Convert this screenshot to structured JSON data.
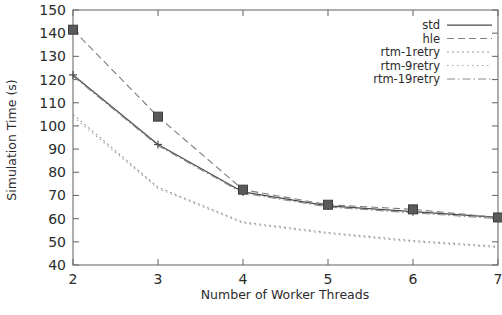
{
  "chart_data": {
    "type": "line",
    "title": "",
    "xlabel": "Number of Worker Threads",
    "ylabel": "Simulation Time (s)",
    "xlim": [
      2,
      7
    ],
    "ylim": [
      40,
      150
    ],
    "xticks": [
      2,
      3,
      4,
      5,
      6,
      7
    ],
    "yticks": [
      40,
      50,
      60,
      70,
      80,
      90,
      100,
      110,
      120,
      130,
      140,
      150
    ],
    "grid": false,
    "legend_position": "top-right",
    "x": [
      2,
      3,
      4,
      5,
      6,
      7
    ],
    "series": [
      {
        "name": "std",
        "style": "solid",
        "color": "#4a4a4a",
        "marker": "plus",
        "values": [
          122,
          92,
          71.5,
          65.5,
          63,
          60.5
        ]
      },
      {
        "name": "hle",
        "style": "dashed",
        "color": "#7d7d7d",
        "marker": "square",
        "values": [
          141.5,
          104,
          72.5,
          66,
          64,
          60.5
        ]
      },
      {
        "name": "rtm-1retry",
        "style": "dotted",
        "color": "#9a9a9a",
        "marker": "none",
        "values": [
          105,
          73.5,
          58.5,
          54,
          50.5,
          48
        ]
      },
      {
        "name": "rtm-9retry",
        "style": "fine-dotted",
        "color": "#a8a8a8",
        "marker": "none",
        "values": [
          104,
          73,
          58,
          53.5,
          50,
          47.5
        ]
      },
      {
        "name": "rtm-19retry",
        "style": "dash-dot",
        "color": "#8a8a8a",
        "marker": "none",
        "values": [
          121.5,
          91.5,
          71,
          65,
          62.5,
          60
        ]
      }
    ]
  },
  "axes": {
    "x_tick_labels": [
      "2",
      "3",
      "4",
      "5",
      "6",
      "7"
    ],
    "y_tick_labels": [
      "40",
      "50",
      "60",
      "70",
      "80",
      "90",
      "100",
      "110",
      "120",
      "130",
      "140",
      "150"
    ],
    "x_axis_title": "Number of Worker Threads",
    "y_axis_title": "Simulation Time (s)"
  },
  "legend": {
    "entries": [
      {
        "label": "std"
      },
      {
        "label": "hle"
      },
      {
        "label": "rtm-1retry"
      },
      {
        "label": "rtm-9retry"
      },
      {
        "label": "rtm-19retry"
      }
    ]
  }
}
